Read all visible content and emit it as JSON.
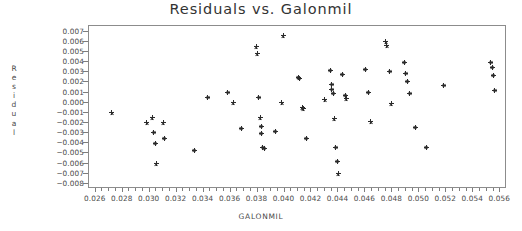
{
  "chart_data": {
    "type": "scatter",
    "title": "Residuals vs. Galonmil",
    "xlabel": "GALONMIL",
    "ylabel": "Residual",
    "ylabel_stacked": [
      "R",
      "e",
      "s",
      "i",
      "d",
      "u",
      "a",
      "l"
    ],
    "xlim": [
      0.0255,
      0.0565
    ],
    "ylim": [
      -0.0085,
      0.00755
    ],
    "grid": false,
    "legend": null,
    "marker": "asterisk",
    "marker_color": "#2b2b2b",
    "xticks": [
      0.026,
      0.028,
      0.03,
      0.032,
      0.034,
      0.036,
      0.038,
      0.04,
      0.042,
      0.044,
      0.046,
      0.048,
      0.05,
      0.052,
      0.054,
      0.056
    ],
    "xtick_labels": [
      "0.026",
      "0.028",
      "0.030",
      "0.032",
      "0.034",
      "0.036",
      "0.038",
      "0.040",
      "0.042",
      "0.044",
      "0.046",
      "0.048",
      "0.050",
      "0.052",
      "0.054",
      "0.056"
    ],
    "xtick_minor_step": 0.0005,
    "yticks": [
      0.007,
      0.006,
      0.005,
      0.004,
      0.003,
      0.002,
      0.001,
      0.0,
      -0.001,
      -0.002,
      -0.003,
      -0.004,
      -0.005,
      -0.006,
      -0.007,
      -0.008
    ],
    "ytick_labels": [
      "0.007",
      "0.006",
      "0.005",
      "0.004",
      "0.003",
      "0.002",
      "0.001",
      "0.000",
      "-0.001",
      "-0.002",
      "-0.003",
      "-0.004",
      "-0.005",
      "-0.006",
      "-0.007",
      "-0.008"
    ],
    "points": [
      [
        0.0272,
        -0.001
      ],
      [
        0.0298,
        -0.002
      ],
      [
        0.0302,
        -0.0015
      ],
      [
        0.0303,
        -0.0029
      ],
      [
        0.0304,
        -0.004
      ],
      [
        0.0305,
        -0.006
      ],
      [
        0.031,
        -0.002
      ],
      [
        0.0311,
        -0.0035
      ],
      [
        0.0333,
        -0.0047
      ],
      [
        0.0343,
        0.0005
      ],
      [
        0.0358,
        0.001
      ],
      [
        0.0362,
        0.0
      ],
      [
        0.0368,
        -0.0025
      ],
      [
        0.0379,
        0.0055
      ],
      [
        0.038,
        0.0048
      ],
      [
        0.0381,
        0.0005
      ],
      [
        0.0382,
        -0.0015
      ],
      [
        0.0383,
        -0.0023
      ],
      [
        0.0383,
        -0.003
      ],
      [
        0.0384,
        -0.0044
      ],
      [
        0.0385,
        -0.0045
      ],
      [
        0.0393,
        -0.0028
      ],
      [
        0.0398,
        0.0
      ],
      [
        0.0399,
        0.0066
      ],
      [
        0.041,
        0.0025
      ],
      [
        0.0411,
        0.0024
      ],
      [
        0.0413,
        -0.0005
      ],
      [
        0.0414,
        -0.0006
      ],
      [
        0.0416,
        -0.0035
      ],
      [
        0.043,
        0.0003
      ],
      [
        0.0434,
        0.0032
      ],
      [
        0.0435,
        0.0018
      ],
      [
        0.0435,
        0.0013
      ],
      [
        0.0436,
        0.0009
      ],
      [
        0.0437,
        -0.0016
      ],
      [
        0.0438,
        -0.0044
      ],
      [
        0.0439,
        -0.0058
      ],
      [
        0.044,
        -0.007
      ],
      [
        0.0443,
        0.0028
      ],
      [
        0.0445,
        0.0007
      ],
      [
        0.0446,
        0.0004
      ],
      [
        0.046,
        0.0033
      ],
      [
        0.0462,
        0.001
      ],
      [
        0.0464,
        -0.0019
      ],
      [
        0.0475,
        0.006
      ],
      [
        0.0476,
        0.0056
      ],
      [
        0.0478,
        0.0031
      ],
      [
        0.0479,
        -0.0001
      ],
      [
        0.0489,
        0.004
      ],
      [
        0.049,
        0.0029
      ],
      [
        0.0491,
        0.0021
      ],
      [
        0.0493,
        0.0009
      ],
      [
        0.0497,
        -0.0024
      ],
      [
        0.0505,
        -0.0044
      ],
      [
        0.0518,
        0.0017
      ],
      [
        0.0553,
        0.004
      ],
      [
        0.0554,
        0.0035
      ],
      [
        0.0555,
        0.0027
      ],
      [
        0.0556,
        0.0012
      ]
    ]
  }
}
